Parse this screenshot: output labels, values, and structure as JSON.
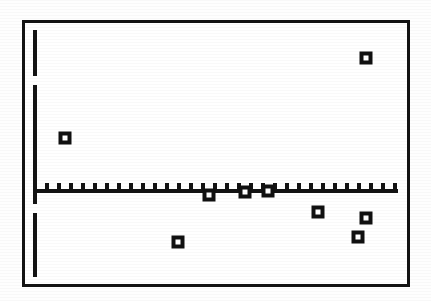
{
  "figure": {
    "kind": "scanned-scatter-plot",
    "background_color": "#ffffff",
    "ink_color": "#131313",
    "frame": {
      "x": 22,
      "y": 20,
      "width": 388,
      "height": 267,
      "stroke": 3
    }
  },
  "chart_data": {
    "type": "scatter",
    "title": "",
    "subtitle": "",
    "xlabel": "",
    "ylabel": "",
    "legend": [],
    "annotations": [],
    "grid": false,
    "legend_position": "none",
    "axes": {
      "x_axis": {
        "visible": true,
        "baseline_y_px": 189,
        "start_x_px": 33,
        "end_x_px": 398,
        "tick_count": 31,
        "tick_spacing_px": 12,
        "tick_direction": "up",
        "tick_length_px": 6,
        "tick_labels": []
      },
      "y_axis": {
        "visible": true,
        "x_px": 33,
        "top_y_px": 30,
        "bottom_y_px": 277,
        "breaks": [
          {
            "from_y_px": 76,
            "to_y_px": 85
          },
          {
            "from_y_px": 204,
            "to_y_px": 213
          }
        ],
        "tick_labels": []
      },
      "xlim_px": [
        33,
        398
      ],
      "ylim_px": [
        30,
        277
      ]
    },
    "series": [
      {
        "name": "residuals",
        "marker": "open-center-square",
        "marker_size_px": 13,
        "points": [
          {
            "x_px": 65,
            "y_px": 138
          },
          {
            "x_px": 178,
            "y_px": 242
          },
          {
            "x_px": 209,
            "y_px": 195
          },
          {
            "x_px": 245,
            "y_px": 192
          },
          {
            "x_px": 268,
            "y_px": 191
          },
          {
            "x_px": 318,
            "y_px": 212
          },
          {
            "x_px": 358,
            "y_px": 237
          },
          {
            "x_px": 366,
            "y_px": 218
          },
          {
            "x_px": 366,
            "y_px": 58
          }
        ]
      }
    ]
  }
}
